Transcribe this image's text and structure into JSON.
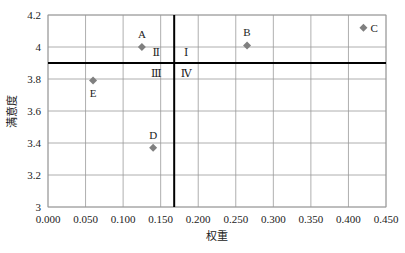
{
  "chart_data": {
    "type": "scatter",
    "title": "",
    "xlabel": "权重",
    "ylabel": "满意度",
    "xlim": [
      0,
      0.45
    ],
    "ylim": [
      3,
      4.2
    ],
    "xticks": [
      "0.000",
      "0.050",
      "0.100",
      "0.150",
      "0.200",
      "0.250",
      "0.300",
      "0.350",
      "0.400",
      "0.450"
    ],
    "yticks": [
      "3",
      "3.2",
      "3.4",
      "3.6",
      "3.8",
      "4",
      "4.2"
    ],
    "grid": true,
    "legend": null,
    "series": [
      {
        "name": "items",
        "color": "#7f7f7f",
        "marker": "diamond",
        "points": [
          {
            "label": "A",
            "x": 0.125,
            "y": 4.0
          },
          {
            "label": "B",
            "x": 0.265,
            "y": 4.01
          },
          {
            "label": "C",
            "x": 0.42,
            "y": 4.12
          },
          {
            "label": "D",
            "x": 0.14,
            "y": 3.37
          },
          {
            "label": "E",
            "x": 0.06,
            "y": 3.79
          }
        ]
      }
    ],
    "reference_lines": {
      "vertical_x": 0.168,
      "horizontal_y": 3.9
    },
    "quadrant_labels": [
      {
        "label": "Ⅰ",
        "position": "upper-right"
      },
      {
        "label": "Ⅱ",
        "position": "upper-left"
      },
      {
        "label": "Ⅲ",
        "position": "lower-left"
      },
      {
        "label": "Ⅳ",
        "position": "lower-right"
      }
    ]
  }
}
